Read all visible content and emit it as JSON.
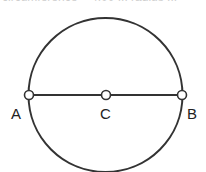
{
  "caption": {
    "text": "circumference = 4.00 ... radius ...",
    "clipped": true
  },
  "figure": {
    "type": "circle-with-diameter",
    "stroke_color": "#333333",
    "point_fill": "#ffffff",
    "circle": {
      "cx": 105.5,
      "cy": 95,
      "r": 77
    },
    "diameter": {
      "from": "A",
      "to": "B"
    },
    "points": [
      {
        "id": "A",
        "label": "A",
        "x": 29,
        "y": 95
      },
      {
        "id": "C",
        "label": "C",
        "x": 106,
        "y": 95
      },
      {
        "id": "B",
        "label": "B",
        "x": 182,
        "y": 95
      }
    ]
  }
}
